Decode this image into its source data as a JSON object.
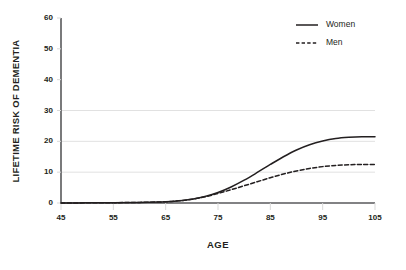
{
  "chart_data": {
    "type": "line",
    "title": "",
    "xlabel": "AGE",
    "ylabel": "LIFETIME RISK OF DEMENTIA",
    "xlim": [
      45,
      105
    ],
    "ylim": [
      0,
      60
    ],
    "xticks": [
      45,
      55,
      65,
      75,
      85,
      95,
      105
    ],
    "yticks": [
      0,
      10,
      20,
      30,
      40,
      50,
      60
    ],
    "xtick_labels": [
      "45",
      "55",
      "65",
      "75",
      "85",
      "95",
      "105"
    ],
    "ytick_labels": [
      "0",
      "10",
      "20",
      "30",
      "40",
      "50",
      "60"
    ],
    "grid": true,
    "gridlines_y": [
      10,
      20,
      30
    ],
    "legend_position": "top-right",
    "x": [
      45,
      50,
      55,
      60,
      65,
      67.5,
      70,
      72.5,
      75,
      77.5,
      80,
      82.5,
      85,
      87.5,
      90,
      92.5,
      95,
      97.5,
      100,
      102.5,
      105
    ],
    "series": [
      {
        "name": "Women",
        "style": "solid",
        "color": "#231f20",
        "values": [
          0.0,
          0.05,
          0.1,
          0.2,
          0.4,
          0.7,
          1.2,
          2.1,
          3.4,
          5.2,
          7.4,
          9.9,
          12.5,
          15.0,
          17.2,
          18.9,
          20.1,
          20.9,
          21.3,
          21.5,
          21.5
        ]
      },
      {
        "name": "Men",
        "style": "dashed",
        "color": "#231f20",
        "values": [
          0.0,
          0.05,
          0.1,
          0.2,
          0.4,
          0.7,
          1.2,
          2.0,
          3.1,
          4.3,
          5.6,
          6.9,
          8.2,
          9.4,
          10.4,
          11.2,
          11.8,
          12.2,
          12.4,
          12.5,
          12.5
        ]
      }
    ]
  },
  "legend": {
    "items": [
      {
        "label": "Women"
      },
      {
        "label": "Men"
      }
    ]
  },
  "axis_color": "#58595b",
  "grid_color": "#d9d9d9",
  "line_color": "#231f20"
}
